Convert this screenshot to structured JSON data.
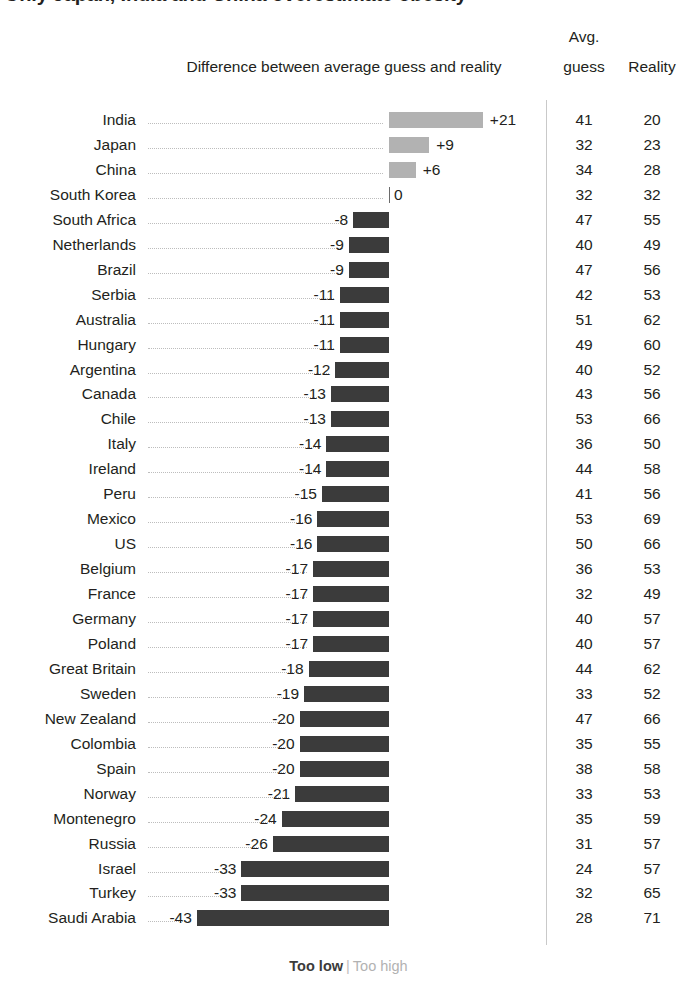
{
  "title": "Only Japan, India and China overestimate obesity",
  "header": {
    "diff_label": "Difference between average guess and reality",
    "avg_line1": "Avg.",
    "avg_line2": "guess",
    "reality": "Reality"
  },
  "legend": {
    "too_low": "Too low",
    "separator": "|",
    "too_high": "Too high"
  },
  "colors": {
    "negative_bar": "#3b3b3b",
    "positive_bar": "#b2b2b2",
    "text": "#231f20",
    "leader_line": "#bdbdbd",
    "divider": "#c9c9c9",
    "background": "#ffffff"
  },
  "chart_data": {
    "type": "bar",
    "title": "Only Japan, India and China overestimate obesity",
    "xlabel": "Difference between average guess and reality",
    "ylabel": "",
    "orientation": "horizontal",
    "grid": false,
    "legend_position": "bottom",
    "zero_baseline": 0,
    "xlim": [
      -43,
      21
    ],
    "categories": [
      "India",
      "Japan",
      "China",
      "South Korea",
      "South Africa",
      "Netherlands",
      "Brazil",
      "Serbia",
      "Australia",
      "Hungary",
      "Argentina",
      "Canada",
      "Chile",
      "Italy",
      "Ireland",
      "Peru",
      "Mexico",
      "US",
      "Belgium",
      "France",
      "Germany",
      "Poland",
      "Great Britain",
      "Sweden",
      "New Zealand",
      "Colombia",
      "Spain",
      "Norway",
      "Montenegro",
      "Russia",
      "Israel",
      "Turkey",
      "Saudi Arabia"
    ],
    "series": [
      {
        "name": "Difference between average guess and reality",
        "values": [
          21,
          9,
          6,
          0,
          -8,
          -9,
          -9,
          -11,
          -11,
          -11,
          -12,
          -13,
          -13,
          -14,
          -14,
          -15,
          -16,
          -16,
          -17,
          -17,
          -17,
          -17,
          -18,
          -19,
          -20,
          -20,
          -20,
          -21,
          -24,
          -26,
          -33,
          -33,
          -43
        ]
      },
      {
        "name": "Avg. guess",
        "values": [
          41,
          32,
          34,
          32,
          47,
          40,
          47,
          42,
          51,
          49,
          40,
          43,
          53,
          36,
          44,
          41,
          53,
          50,
          36,
          32,
          40,
          40,
          44,
          33,
          47,
          35,
          38,
          33,
          35,
          31,
          24,
          32,
          28
        ]
      },
      {
        "name": "Reality",
        "values": [
          20,
          23,
          28,
          32,
          55,
          49,
          56,
          53,
          62,
          60,
          52,
          56,
          66,
          50,
          58,
          56,
          69,
          66,
          53,
          49,
          57,
          57,
          62,
          52,
          66,
          55,
          58,
          53,
          59,
          57,
          57,
          65,
          71
        ]
      }
    ],
    "diff_labels": [
      "+21",
      "+9",
      "+6",
      "0",
      "-8",
      "-9",
      "-9",
      "-11",
      "-11",
      "-11",
      "-12",
      "-13",
      "-13",
      "-14",
      "-14",
      "-15",
      "-16",
      "-16",
      "-17",
      "-17",
      "-17",
      "-17",
      "-18",
      "-19",
      "-20",
      "-20",
      "-20",
      "-21",
      "-24",
      "-26",
      "-33",
      "-33",
      "-43"
    ]
  }
}
